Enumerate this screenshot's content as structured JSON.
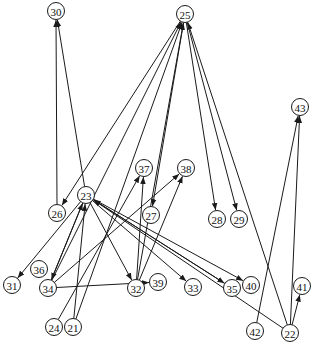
{
  "diagram": {
    "type": "directed-graph",
    "node_radius": 8.5,
    "colors": {
      "stroke": "#1a1a1a",
      "fill": "#ffffff",
      "text": "#111111",
      "background": "#ffffff"
    },
    "nodes": [
      {
        "id": "30",
        "label": "30",
        "x": 56,
        "y": 11
      },
      {
        "id": "25",
        "label": "25",
        "x": 185,
        "y": 14
      },
      {
        "id": "43",
        "label": "43",
        "x": 300,
        "y": 107
      },
      {
        "id": "37",
        "label": "37",
        "x": 144,
        "y": 168
      },
      {
        "id": "38",
        "label": "38",
        "x": 186,
        "y": 168
      },
      {
        "id": "23",
        "label": "23",
        "x": 86,
        "y": 195
      },
      {
        "id": "26",
        "label": "26",
        "x": 57,
        "y": 213
      },
      {
        "id": "27",
        "label": "27",
        "x": 151,
        "y": 215
      },
      {
        "id": "28",
        "label": "28",
        "x": 217,
        "y": 219
      },
      {
        "id": "29",
        "label": "29",
        "x": 239,
        "y": 219
      },
      {
        "id": "31",
        "label": "31",
        "x": 12,
        "y": 285
      },
      {
        "id": "36",
        "label": "36",
        "x": 39,
        "y": 269
      },
      {
        "id": "34",
        "label": "34",
        "x": 48,
        "y": 288
      },
      {
        "id": "32",
        "label": "32",
        "x": 136,
        "y": 288
      },
      {
        "id": "39",
        "label": "39",
        "x": 158,
        "y": 282
      },
      {
        "id": "33",
        "label": "33",
        "x": 193,
        "y": 287
      },
      {
        "id": "35",
        "label": "35",
        "x": 232,
        "y": 288
      },
      {
        "id": "40",
        "label": "40",
        "x": 251,
        "y": 285
      },
      {
        "id": "41",
        "label": "41",
        "x": 302,
        "y": 286
      },
      {
        "id": "24",
        "label": "24",
        "x": 54,
        "y": 327
      },
      {
        "id": "21",
        "label": "21",
        "x": 73,
        "y": 327
      },
      {
        "id": "42",
        "label": "42",
        "x": 255,
        "y": 331
      },
      {
        "id": "22",
        "label": "22",
        "x": 290,
        "y": 333
      }
    ],
    "edges": [
      {
        "from": "26",
        "to": "30"
      },
      {
        "from": "23",
        "to": "30"
      },
      {
        "from": "25",
        "to": "26"
      },
      {
        "from": "34",
        "to": "25"
      },
      {
        "from": "21",
        "to": "25"
      },
      {
        "from": "32",
        "to": "25"
      },
      {
        "from": "25",
        "to": "27"
      },
      {
        "from": "25",
        "to": "28"
      },
      {
        "from": "25",
        "to": "29"
      },
      {
        "from": "22",
        "to": "25"
      },
      {
        "from": "42",
        "to": "43"
      },
      {
        "from": "22",
        "to": "43"
      },
      {
        "from": "22",
        "to": "41"
      },
      {
        "from": "24",
        "to": "37"
      },
      {
        "from": "32",
        "to": "37"
      },
      {
        "from": "34",
        "to": "38"
      },
      {
        "from": "32",
        "to": "38"
      },
      {
        "from": "23",
        "to": "31"
      },
      {
        "from": "23",
        "to": "34"
      },
      {
        "from": "21",
        "to": "23"
      },
      {
        "from": "34",
        "to": "23"
      },
      {
        "from": "23",
        "to": "32"
      },
      {
        "from": "23",
        "to": "33"
      },
      {
        "from": "23",
        "to": "35"
      },
      {
        "from": "23",
        "to": "40"
      },
      {
        "from": "35",
        "to": "23"
      },
      {
        "from": "22",
        "to": "23"
      },
      {
        "from": "34",
        "to": "39"
      }
    ]
  }
}
